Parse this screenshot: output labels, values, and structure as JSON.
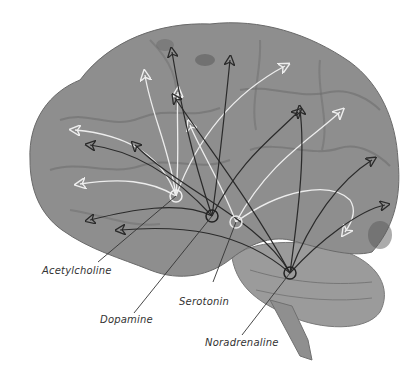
{
  "figure": {
    "colors": {
      "brain_fill": "#8e8e8e",
      "brain_dark": "#6f6f6f",
      "cerebellum_fill": "#999999",
      "dark_arrow": "#2a2a2a",
      "light_arrow": "#e8e8e8",
      "label_line": "#333333"
    },
    "labels": [
      {
        "id": "acetylcholine",
        "text": "Acetylcholine",
        "x": 42,
        "y": 268
      },
      {
        "id": "dopamine",
        "text": "Dopamine",
        "x": 100,
        "y": 291
      },
      {
        "id": "serotonin",
        "text": "Serotonin",
        "x": 179,
        "y": 267
      },
      {
        "id": "noradrenaline",
        "text": "Noradrenaline",
        "x": 205,
        "y": 309
      }
    ],
    "origins": [
      {
        "id": "acetylcholine",
        "cx": 176,
        "cy": 196,
        "shade": "light"
      },
      {
        "id": "dopamine",
        "cx": 212,
        "cy": 216,
        "shade": "dark"
      },
      {
        "id": "serotonin",
        "cx": 236,
        "cy": 222,
        "shade": "light"
      },
      {
        "id": "noradrenaline",
        "cx": 290,
        "cy": 273,
        "shade": "dark"
      }
    ]
  }
}
